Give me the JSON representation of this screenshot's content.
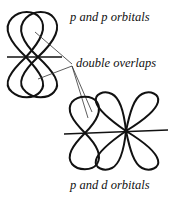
{
  "labels": {
    "pp": "p and p orbitals",
    "overlap": "double overlaps",
    "pd": "p and d orbitals"
  },
  "colors": {
    "stroke": "#111111",
    "background": "#ffffff"
  }
}
